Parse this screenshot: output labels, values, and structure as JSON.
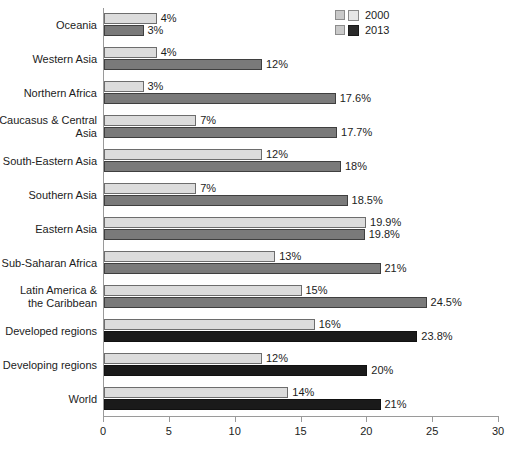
{
  "legend": {
    "position": "top-right",
    "items": [
      {
        "label": "2000",
        "color": "#dcdcdc",
        "series_key": "2000"
      },
      {
        "label": "2013",
        "color": "#7a7a7a",
        "series_key": "2013"
      }
    ]
  },
  "axis": {
    "x_ticks": [
      "0",
      "5",
      "10",
      "15",
      "20",
      "25",
      "30"
    ],
    "x_min": 0,
    "x_max": 30
  },
  "colors": {
    "bar_2000": "#dcdcdc",
    "bar_2000_border": "#6d6d6d",
    "bar_2013": "#7a7a7a",
    "bar_2013_border": "#3f3f3f",
    "bar_2013_dark": "#1a1a1a",
    "axis": "#9a9a9a",
    "text": "#1c1c1c",
    "background": "#ffffff"
  },
  "chart_data": {
    "type": "bar",
    "orientation": "horizontal",
    "title": "",
    "subtitle": "",
    "xlabel": "",
    "ylabel": "",
    "xlim": [
      0,
      30
    ],
    "xticks": [
      0,
      5,
      10,
      15,
      20,
      25,
      30
    ],
    "grid": false,
    "legend_position": "top-right",
    "categories": [
      "Oceania",
      "Western Asia",
      "Northern Africa",
      "Caucasus & Central\nAsia",
      "South-Eastern Asia",
      "Southern Asia",
      "Eastern Asia",
      "Sub-Saharan Africa",
      "Latin America &\nthe Caribbean",
      "Developed regions",
      "Developing regions",
      "World"
    ],
    "series": [
      {
        "name": "2000",
        "values": [
          4,
          4,
          3,
          7,
          12,
          7,
          19.9,
          13,
          15,
          16,
          12,
          14
        ],
        "labels": [
          "4%",
          "4%",
          "3%",
          "7%",
          "12%",
          "7%",
          "19.9%",
          "13%",
          "15%",
          "16%",
          "12%",
          "14%"
        ]
      },
      {
        "name": "2013",
        "values": [
          3,
          12,
          17.6,
          17.7,
          18,
          18.5,
          19.8,
          21,
          24.5,
          23.8,
          20,
          21
        ],
        "labels": [
          "3%",
          "12%",
          "17.6%",
          "17.7%",
          "18%",
          "18.5%",
          "19.8%",
          "21%",
          "24.5%",
          "23.8%",
          "20%",
          "21%"
        ],
        "dark_rows": [
          9,
          10,
          11
        ]
      }
    ]
  }
}
